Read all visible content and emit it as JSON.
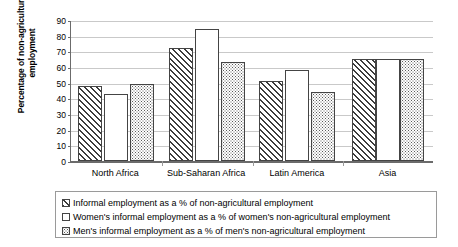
{
  "chart_data": {
    "type": "bar",
    "title": "",
    "xlabel": "",
    "ylabel": "Percentage of non-agricultural employment",
    "ylim": [
      0,
      90
    ],
    "ytick_step": 10,
    "yticks": [
      "90",
      "80",
      "70",
      "60",
      "50",
      "40",
      "30",
      "20",
      "10",
      "0"
    ],
    "grid": true,
    "legend_position": "bottom",
    "categories": [
      "North Africa",
      "Sub-Saharan Africa",
      "Latin America",
      "Asia"
    ],
    "series": [
      {
        "name": "Informal employment as a % of non-agricultural employment",
        "pattern": "diagonal-hatch",
        "values": [
          48,
          72,
          51,
          65
        ]
      },
      {
        "name": "Women's informal employment as a % of women's non-agricultural employment",
        "pattern": "light-dots",
        "values": [
          43,
          84,
          58,
          65
        ]
      },
      {
        "name": "Men's informal employment as a % of men's non-agricultural employment",
        "pattern": "dense-dots",
        "values": [
          49,
          63,
          44,
          65
        ]
      }
    ]
  },
  "colors": {
    "axis": "#6b6b6b",
    "gridline": "#c9c9c9",
    "bar_outline": "#444444",
    "background": "#ffffff",
    "text": "#000000"
  }
}
